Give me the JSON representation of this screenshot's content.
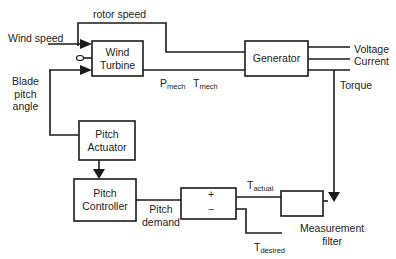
{
  "blocks": {
    "wind_turbine": {
      "line1": "Wind",
      "line2": "Turbine"
    },
    "generator": {
      "label": "Generator"
    },
    "pitch_actuator": {
      "line1": "Pitch",
      "line2": "Actuator"
    },
    "pitch_controller": {
      "line1": "Pitch",
      "line2": "Controller"
    },
    "summing_junction": {
      "plus": "+",
      "minus": "−"
    },
    "measurement_filter": {
      "line1": "Measurement",
      "line2": "filter"
    }
  },
  "signals": {
    "rotor_speed": "rotor speed",
    "wind_speed": "Wind speed",
    "blade_pitch": {
      "line1": "Blade",
      "line2": "pitch",
      "line3": "angle"
    },
    "p_mech": {
      "main": "P",
      "sub": "mech"
    },
    "t_mech": {
      "main": "T",
      "sub": "mech"
    },
    "voltage": "Voltage",
    "current": "Current",
    "torque": "Torque",
    "t_actual": {
      "main": "T",
      "sub": "actual"
    },
    "t_desired": {
      "main": "T",
      "sub": "desired"
    },
    "pitch_demand": {
      "line1": "Pitch",
      "line2": "demand"
    }
  },
  "colors": {
    "line": "#1a1a1a",
    "background": "#ffffff"
  }
}
